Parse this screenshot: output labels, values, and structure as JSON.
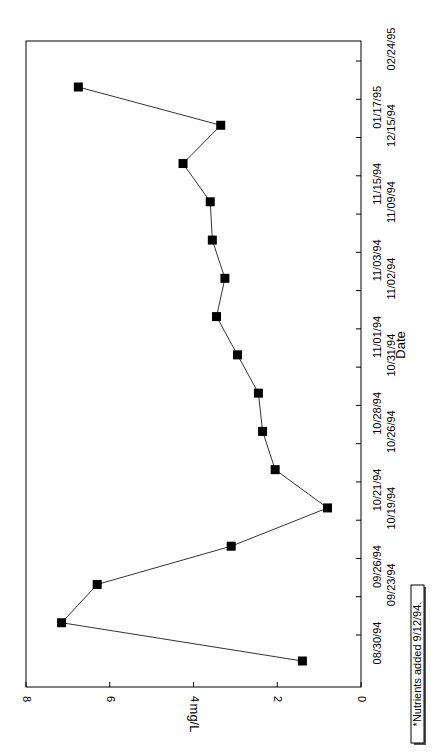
{
  "chart_data": {
    "type": "line",
    "orientation": "rotated-90-clockwise",
    "title": "",
    "xlabel": "Date",
    "ylabel": "mg/L",
    "ylim": [
      0,
      8
    ],
    "yticks": [
      0,
      2,
      4,
      6,
      8
    ],
    "grid": false,
    "marker": "filled-square",
    "categories": [
      "08/30/94",
      "09/23/94",
      "09/26/94",
      "10/19/94",
      "10/21/94",
      "10/26/94",
      "10/28/94",
      "10/31/94",
      "11/01/94",
      "11/02/94",
      "11/03/94",
      "11/09/94",
      "11/15/94",
      "12/15/94",
      "01/17/95",
      "02/24/95"
    ],
    "series": [
      {
        "name": "mg/L",
        "values": [
          1.4,
          7.15,
          6.3,
          3.1,
          0.8,
          2.05,
          2.35,
          2.45,
          2.95,
          3.45,
          3.25,
          3.55,
          3.6,
          4.25,
          3.35,
          6.75
        ]
      }
    ],
    "annotations": [
      "*Nutrients added 9/12/94."
    ]
  },
  "note": "*Nutrients added 9/12/94."
}
